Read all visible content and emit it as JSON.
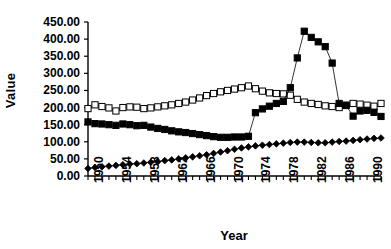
{
  "chart_data": {
    "type": "line",
    "title": "",
    "xlabel": "Year",
    "ylabel": "Value",
    "grid": false,
    "legend": "none",
    "xlim": [
      1950,
      1992
    ],
    "ylim": [
      0,
      450
    ],
    "ytick_labels": [
      "0.00",
      "50.00",
      "100.00",
      "150.00",
      "200.00",
      "250.00",
      "300.00",
      "350.00",
      "400.00",
      "450.00"
    ],
    "ytick_values": [
      0,
      50,
      100,
      150,
      200,
      250,
      300,
      350,
      400,
      450
    ],
    "xtick_labels": [
      "1950",
      "1954",
      "1958",
      "1962",
      "1966",
      "1970",
      "1974",
      "1978",
      "1982",
      "1986",
      "1990"
    ],
    "xtick_values": [
      1950,
      1954,
      1958,
      1962,
      1966,
      1970,
      1974,
      1978,
      1982,
      1986,
      1990
    ],
    "x": [
      1950,
      1951,
      1952,
      1953,
      1954,
      1955,
      1956,
      1957,
      1958,
      1959,
      1960,
      1961,
      1962,
      1963,
      1964,
      1965,
      1966,
      1967,
      1968,
      1969,
      1970,
      1971,
      1972,
      1973,
      1974,
      1975,
      1976,
      1977,
      1978,
      1979,
      1980,
      1981,
      1982,
      1983,
      1984,
      1985,
      1986,
      1987,
      1988,
      1989,
      1990,
      1991,
      1992
    ],
    "series": [
      {
        "name": "open-square-series",
        "marker": "open-square",
        "marker_fill": "#ffffff",
        "marker_edge": "#000000",
        "line_color": "#000000",
        "values": [
          197,
          208,
          203,
          199,
          190,
          200,
          202,
          201,
          197,
          199,
          202,
          205,
          208,
          212,
          216,
          222,
          228,
          235,
          241,
          246,
          250,
          254,
          258,
          263,
          255,
          248,
          243,
          241,
          240,
          236,
          224,
          216,
          212,
          209,
          205,
          203,
          200,
          207,
          212,
          210,
          207,
          204,
          212
        ]
      },
      {
        "name": "filled-square-series",
        "marker": "filled-square",
        "marker_fill": "#000000",
        "marker_edge": "#000000",
        "line_color": "#000000",
        "values": [
          158,
          153,
          152,
          150,
          148,
          152,
          150,
          147,
          148,
          143,
          139,
          136,
          132,
          129,
          127,
          124,
          121,
          118,
          115,
          113,
          113,
          114,
          114,
          116,
          185,
          196,
          204,
          212,
          218,
          258,
          345,
          423,
          405,
          392,
          378,
          330,
          212,
          206,
          175,
          190,
          192,
          186,
          174
        ]
      },
      {
        "name": "filled-diamond-series",
        "marker": "filled-diamond",
        "marker_fill": "#000000",
        "marker_edge": "#000000",
        "line_color": "#000000",
        "values": [
          22,
          25,
          27,
          29,
          31,
          33,
          35,
          36,
          38,
          40,
          42,
          45,
          47,
          50,
          53,
          56,
          59,
          62,
          66,
          70,
          74,
          78,
          82,
          85,
          88,
          90,
          92,
          94,
          96,
          98,
          99,
          99,
          98,
          97,
          97,
          99,
          101,
          102,
          104,
          106,
          108,
          110,
          111
        ]
      }
    ]
  }
}
